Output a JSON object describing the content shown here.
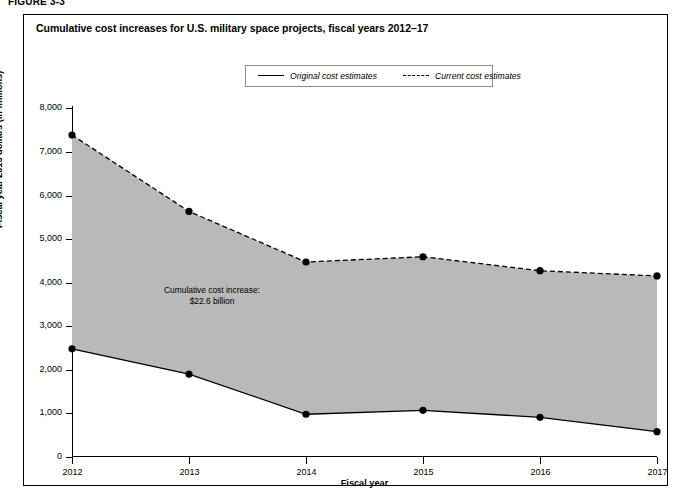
{
  "figure": {
    "number_label": "FIGURE 3-3",
    "title": "Cumulative cost increases for U.S. military space projects, fiscal years 2012–17"
  },
  "legend": {
    "items": [
      {
        "label": "Original cost estimates",
        "style": "solid"
      },
      {
        "label": "Current cost estimates",
        "style": "dashed"
      }
    ]
  },
  "annotation": {
    "line1": "Cumulative cost increase:",
    "line2": "$22.6 billion"
  },
  "axes": {
    "x_title": "Fiscal year",
    "y_title": "Fiscal year 2013 dollars (in millions)",
    "y_ticks": [
      "0",
      "1,000",
      "2,000",
      "3,000",
      "4,000",
      "5,000",
      "6,000",
      "7,000",
      "8,000"
    ],
    "x_ticks": [
      "2012",
      "2013",
      "2014",
      "2015",
      "2016",
      "2017"
    ]
  },
  "colors": {
    "fill": "#b9b9b9",
    "line": "#000000",
    "frame": "#000000",
    "legend_border": "#8d8d8d"
  },
  "chart_data": {
    "type": "area",
    "title": "Cumulative cost increases for U.S. military space projects, fiscal years 2012–17",
    "xlabel": "Fiscal year",
    "ylabel": "Fiscal year 2013 dollars (in millions)",
    "categories": [
      "2012",
      "2013",
      "2014",
      "2015",
      "2016",
      "2017"
    ],
    "x": [
      2012,
      2013,
      2014,
      2015,
      2016,
      2017
    ],
    "xlim": [
      2012,
      2017
    ],
    "ylim": [
      0,
      8000
    ],
    "ytick_values": [
      0,
      1000,
      2000,
      3000,
      4000,
      5000,
      6000,
      7000,
      8000
    ],
    "grid": false,
    "legend_position": "top-center",
    "markers": "filled-circle",
    "shaded_between_series": true,
    "annotations": [
      {
        "text": "Cumulative cost increase: $22.6 billion",
        "x": 2013.0,
        "y": 2900
      }
    ],
    "series": [
      {
        "name": "Current cost estimates",
        "style": "dashed",
        "values": [
          7380,
          5630,
          4470,
          4590,
          4270,
          4150
        ]
      },
      {
        "name": "Original cost estimates",
        "style": "solid",
        "values": [
          2480,
          1900,
          980,
          1070,
          910,
          580
        ]
      }
    ]
  }
}
